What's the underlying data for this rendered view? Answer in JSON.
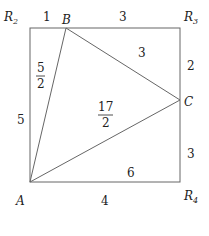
{
  "diagram": {
    "title": "",
    "colors": {
      "line": "#666666",
      "text": "#222222",
      "background": "#ffffff"
    },
    "vertices": {
      "R2": {
        "label": "R",
        "sub": "2"
      },
      "R3": {
        "label": "R",
        "sub": "3"
      },
      "R4": {
        "label": "R",
        "sub": "4"
      },
      "A": {
        "label": "A"
      },
      "B": {
        "label": "B"
      },
      "C": {
        "label": "C"
      }
    },
    "segments": {
      "top_left": "1",
      "top_right": "3",
      "right_upper": "2",
      "right_lower": "3",
      "bottom": "4",
      "left": "5"
    },
    "areas": {
      "left_triangle": {
        "num": "5",
        "den": "2"
      },
      "top_right_triangle": "3",
      "center_triangle": {
        "num": "17",
        "den": "2"
      },
      "bottom_right_triangle": "6"
    }
  }
}
